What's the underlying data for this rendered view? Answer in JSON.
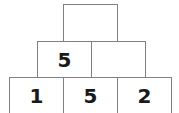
{
  "figure": {
    "type": "number-pyramid",
    "colors": {
      "border": "#808080",
      "background": "#ffffff",
      "text": "#1a1a1a"
    }
  },
  "rows": [
    {
      "name": "top",
      "cells": [
        {
          "value": "",
          "filled": false
        }
      ]
    },
    {
      "name": "middle",
      "cells": [
        {
          "value": "5",
          "filled": true
        },
        {
          "value": "",
          "filled": false
        }
      ]
    },
    {
      "name": "bottom",
      "cells": [
        {
          "value": "1",
          "filled": true
        },
        {
          "value": "5",
          "filled": true
        },
        {
          "value": "2",
          "filled": true
        }
      ]
    }
  ]
}
